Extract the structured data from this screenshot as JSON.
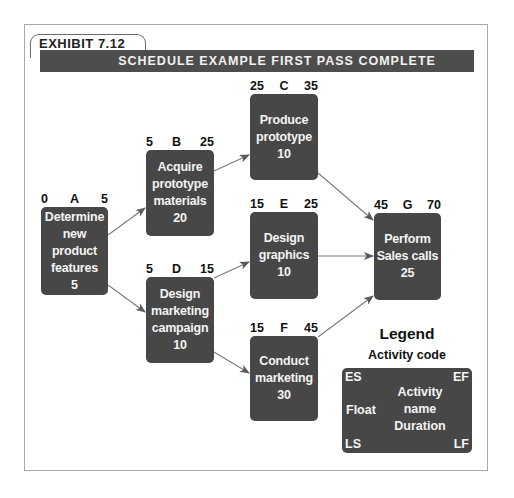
{
  "exhibit": {
    "label": "EXHIBIT 7.12",
    "title": "SCHEDULE EXAMPLE FIRST PASS COMPLETE"
  },
  "nodes": {
    "A": {
      "code": "A",
      "es": "0",
      "ef": "5",
      "lines": [
        "Determine",
        "new",
        "product",
        "features"
      ],
      "duration": "5"
    },
    "B": {
      "code": "B",
      "es": "5",
      "ef": "25",
      "lines": [
        "Acquire",
        "prototype",
        "materials"
      ],
      "duration": "20"
    },
    "C": {
      "code": "C",
      "es": "25",
      "ef": "35",
      "lines": [
        "Produce",
        "prototype"
      ],
      "duration": "10"
    },
    "D": {
      "code": "D",
      "es": "5",
      "ef": "15",
      "lines": [
        "Design",
        "marketing",
        "campaign"
      ],
      "duration": "10"
    },
    "E": {
      "code": "E",
      "es": "15",
      "ef": "25",
      "lines": [
        "Design",
        "graphics"
      ],
      "duration": "10"
    },
    "F": {
      "code": "F",
      "es": "15",
      "ef": "45",
      "lines": [
        "Conduct",
        "marketing"
      ],
      "duration": "30"
    },
    "G": {
      "code": "G",
      "es": "45",
      "ef": "70",
      "lines": [
        "Perform",
        "Sales calls"
      ],
      "duration": "25"
    }
  },
  "edges": [
    [
      "A",
      "B"
    ],
    [
      "A",
      "D"
    ],
    [
      "B",
      "C"
    ],
    [
      "C",
      "G"
    ],
    [
      "D",
      "E"
    ],
    [
      "D",
      "F"
    ],
    [
      "E",
      "G"
    ],
    [
      "F",
      "G"
    ]
  ],
  "legend": {
    "title": "Legend",
    "subtitle": "Activity code",
    "es": "ES",
    "ef": "EF",
    "float": "Float",
    "activity": "Activity",
    "name": "name",
    "duration": "Duration",
    "ls": "LS",
    "lf": "LF"
  },
  "colors": {
    "node_fill": "#474747",
    "title_bar": "#4d4d4d",
    "arrow": "#7a7a7a"
  }
}
